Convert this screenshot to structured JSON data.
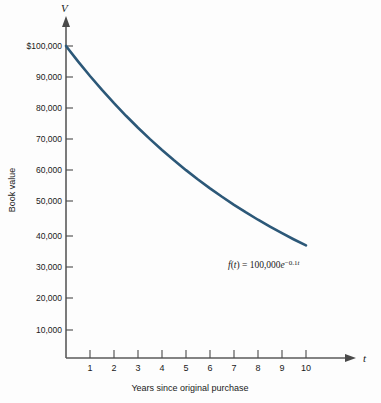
{
  "figure": {
    "title": "",
    "background_color": "#fdfdfd"
  },
  "axes": {
    "y_axis_symbol": "V",
    "x_axis_symbol": "t",
    "y_axis_caption": "Book value",
    "x_axis_caption": "Years since original purchase"
  },
  "annotation": {
    "formula_f": "f",
    "formula_open": "(",
    "formula_var": "t",
    "formula_close": ")",
    "formula_equals": " = ",
    "formula_coefficient": "100,000",
    "formula_base": "e",
    "formula_exponent_sign": "−",
    "formula_exponent_rate": "0.1",
    "formula_exponent_var": "t",
    "formula_full": "f(t) = 100,000e^(-0.1t)"
  },
  "chart_data": {
    "type": "line",
    "title": "",
    "subtitle": "",
    "xlabel": "Years since original purchase",
    "ylabel": "Book value",
    "x_axis_symbol": "t",
    "y_axis_symbol": "V",
    "grid": false,
    "legend": false,
    "legend_position": "none",
    "xlim": [
      0,
      11.6
    ],
    "ylim": [
      0,
      105000
    ],
    "xticks": [
      1,
      2,
      3,
      4,
      5,
      6,
      7,
      8,
      9,
      10
    ],
    "xtick_labels": [
      "1",
      "2",
      "3",
      "4",
      "5",
      "6",
      "7",
      "8",
      "9",
      "10"
    ],
    "yticks": [
      10000,
      20000,
      30000,
      40000,
      50000,
      60000,
      70000,
      80000,
      90000,
      100000
    ],
    "ytick_labels": [
      "10,000",
      "20,000",
      "30,000",
      "40,000",
      "50,000",
      "60,000",
      "70,000",
      "80,000",
      "90,000",
      "$100,000"
    ],
    "annotations": [
      "f(t) = 100,000e^(-0.1t)"
    ],
    "series": [
      {
        "name": "f(t) = 100,000e^(-0.1t)",
        "color": "#2c5878",
        "x": [
          0,
          0.5,
          1,
          1.5,
          2,
          2.5,
          3,
          3.5,
          4,
          4.5,
          5,
          5.5,
          6,
          6.5,
          7,
          7.5,
          8,
          8.5,
          9,
          9.5,
          10
        ],
        "values": [
          100000,
          95123,
          90484,
          86071,
          81873,
          77880,
          74082,
          70469,
          67032,
          63763,
          60653,
          57695,
          54881,
          52205,
          49659,
          47237,
          44933,
          42741,
          40657,
          38674,
          36788
        ]
      }
    ]
  },
  "colors": {
    "curve": "#2c5878",
    "axis": "#5a5a5a",
    "text": "#1a1a1a",
    "background": "#fdfdfd"
  }
}
